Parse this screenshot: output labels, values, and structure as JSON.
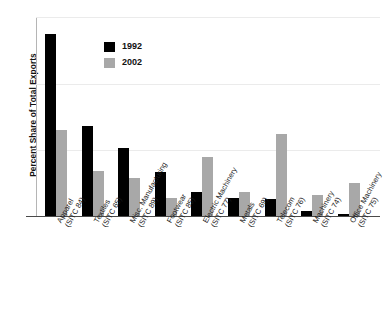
{
  "chart_data": {
    "type": "bar",
    "title": "",
    "xlabel": "",
    "ylabel": "Percent Share of Total Exports",
    "ylim": [
      0,
      3
    ],
    "yticks": [
      0,
      1,
      2,
      3
    ],
    "ytick_labels": [
      "0",
      "1",
      "2",
      "3"
    ],
    "grid": true,
    "legend_position": "upper-center-left",
    "categories": [
      {
        "name": "Apparel",
        "code": "(SITC 84)"
      },
      {
        "name": "Textiles",
        "code": "(SITC 65)"
      },
      {
        "name": "Misc. Manufacturing",
        "code": "(SITC 89)"
      },
      {
        "name": "Footwear",
        "code": "(SITC 85)"
      },
      {
        "name": "Electric Machinery",
        "code": "(SITC 77)"
      },
      {
        "name": "Metals",
        "code": "(SITC 69)"
      },
      {
        "name": "Telecom",
        "code": "(SITC 76)"
      },
      {
        "name": "Machinery",
        "code": "(SITC 74)"
      },
      {
        "name": "Office Machinery",
        "code": "(SITC 75)"
      }
    ],
    "series": [
      {
        "name": "1992",
        "color": "#000000",
        "values": [
          2.75,
          1.36,
          1.03,
          0.68,
          0.38,
          0.28,
          0.27,
          0.09,
          0.04
        ]
      },
      {
        "name": "2002",
        "color": "#a8a8a8",
        "values": [
          1.3,
          0.69,
          0.58,
          0.29,
          0.9,
          0.38,
          1.24,
          0.33,
          0.51
        ]
      }
    ]
  }
}
